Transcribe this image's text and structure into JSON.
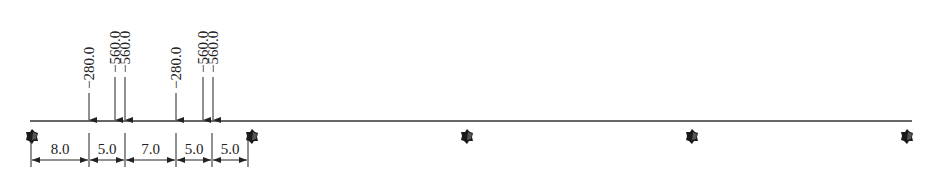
{
  "diagram": {
    "type": "continuous-beam-load-diagram",
    "beam": {
      "x_start": 30,
      "x_end": 912,
      "y": 121,
      "color": "#333333"
    },
    "supports": [
      {
        "x": 32,
        "icon": "support-icon"
      },
      {
        "x": 252,
        "icon": "support-icon"
      },
      {
        "x": 467,
        "icon": "support-icon"
      },
      {
        "x": 692,
        "icon": "support-icon"
      },
      {
        "x": 907,
        "icon": "support-icon"
      }
    ],
    "loads": [
      {
        "x": 89,
        "label": "−280.0",
        "top": 93
      },
      {
        "x": 115,
        "label": "−560.0",
        "top": 77
      },
      {
        "x": 125,
        "label": "−560.0",
        "top": 77
      },
      {
        "x": 176,
        "label": "−280.0",
        "top": 93
      },
      {
        "x": 203,
        "label": "−560.0",
        "top": 77
      },
      {
        "x": 213,
        "label": "−560.0",
        "top": 77
      }
    ],
    "dimensions": {
      "y": 160,
      "tick_top": 133,
      "tick_bottom": 167,
      "ticks": [
        31,
        89,
        125,
        176,
        212,
        248
      ],
      "segments": [
        {
          "label": "8.0"
        },
        {
          "label": "5.0"
        },
        {
          "label": "7.0"
        },
        {
          "label": "5.0"
        },
        {
          "label": "5.0"
        }
      ]
    }
  }
}
